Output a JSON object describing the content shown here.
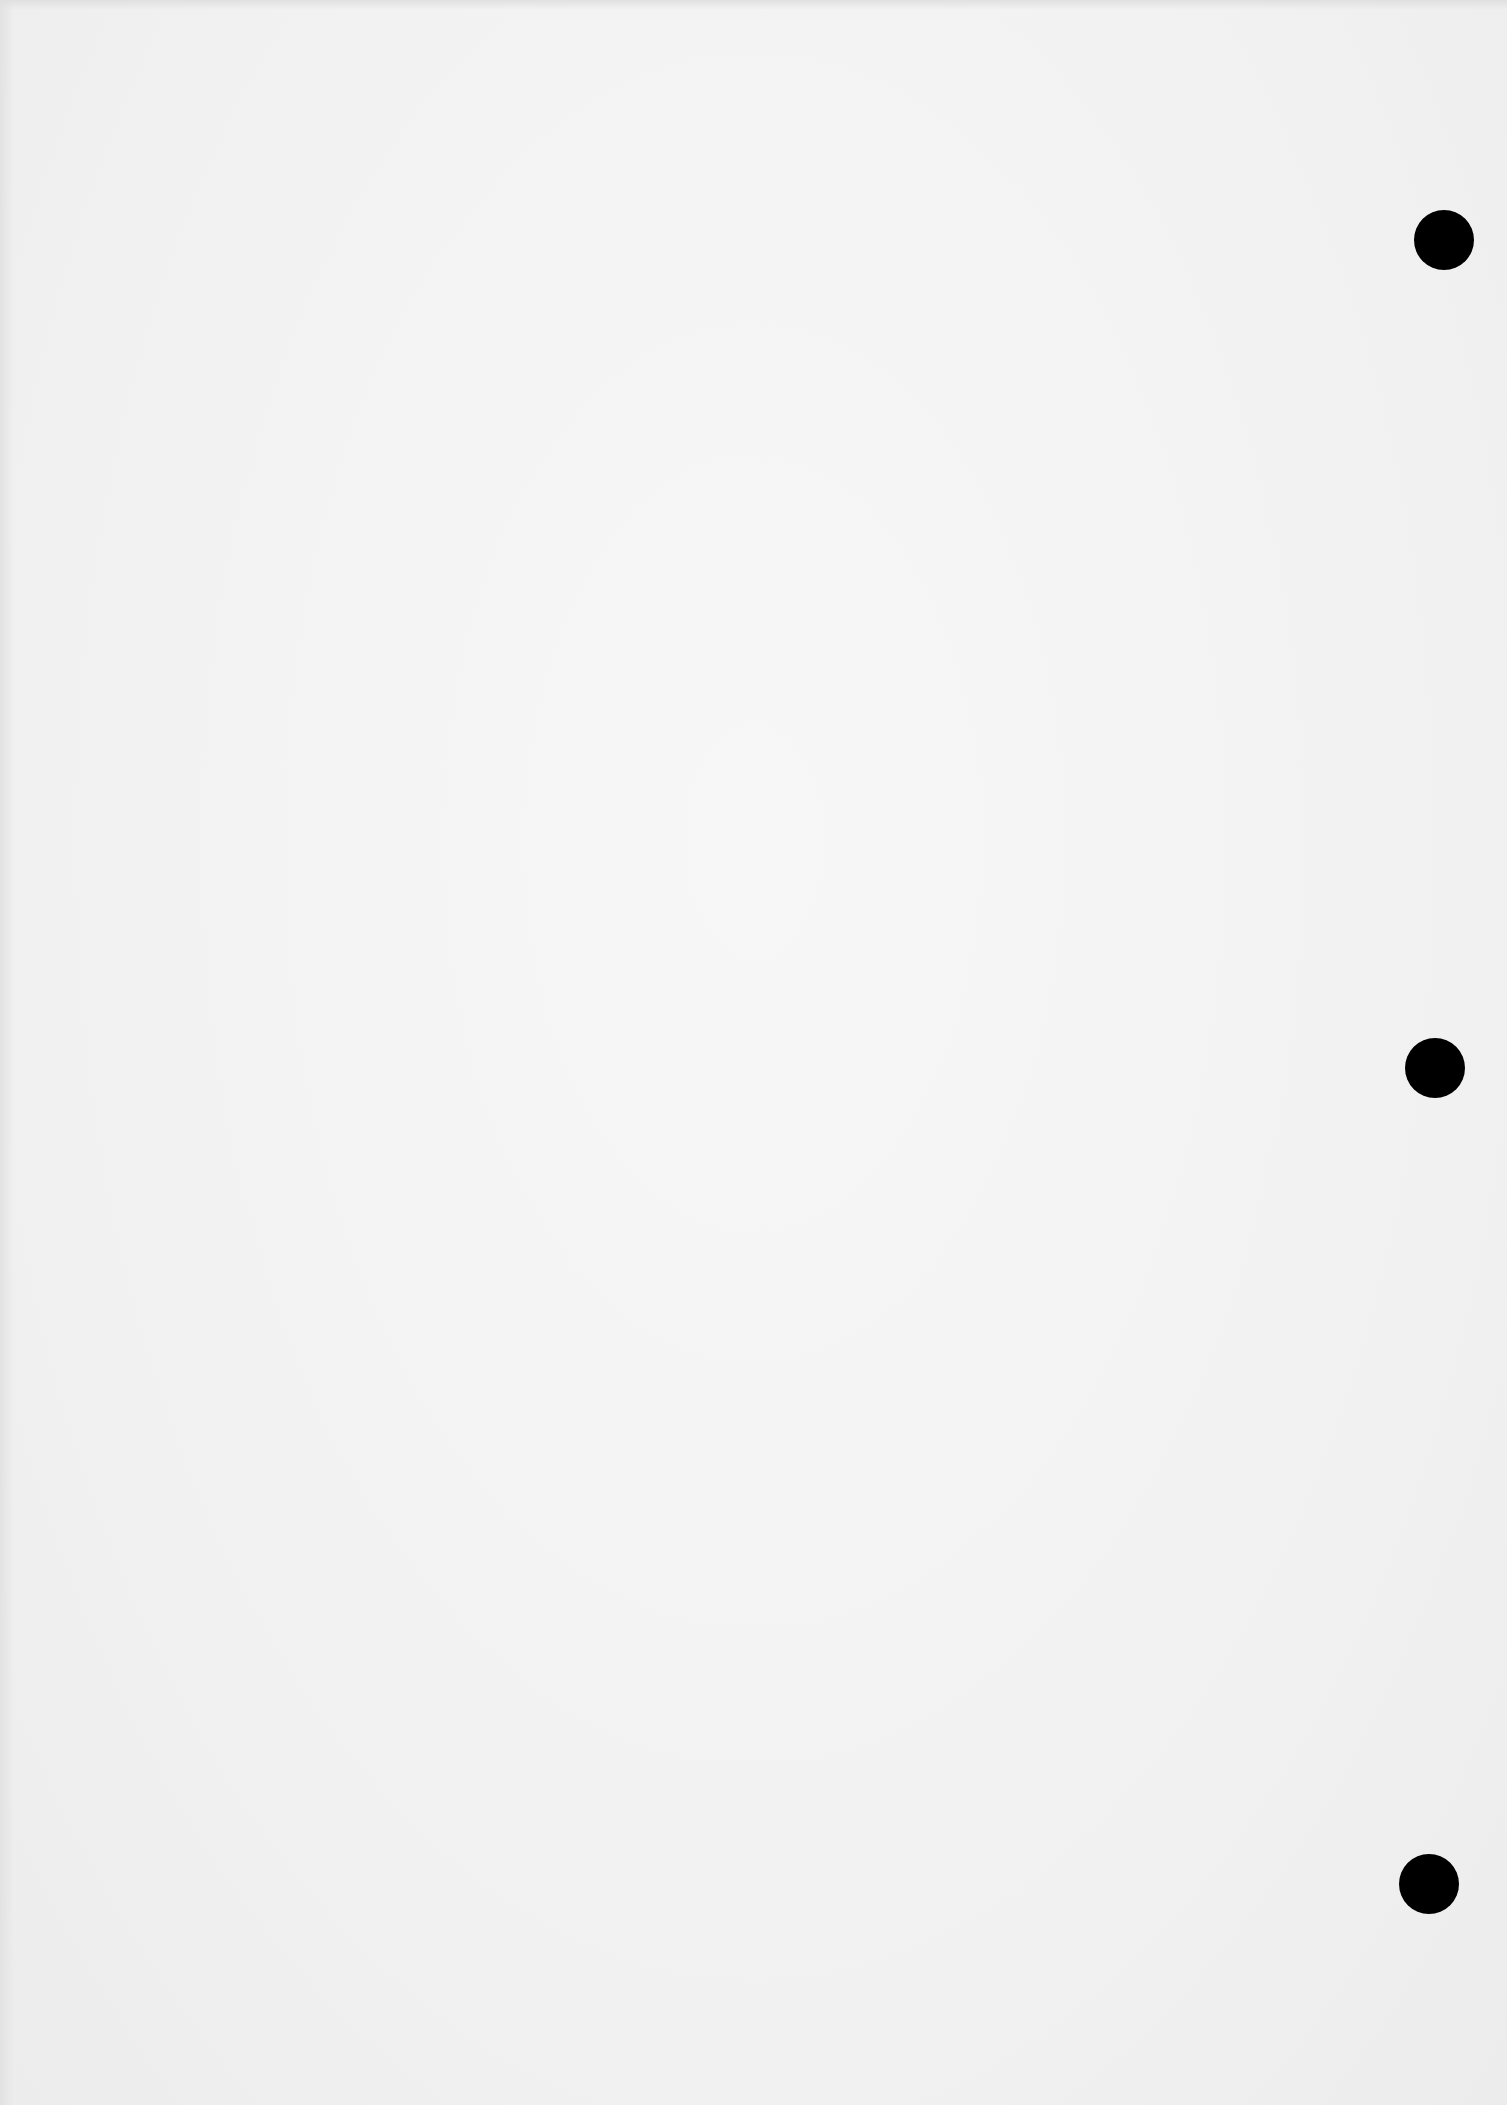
{
  "document": {
    "type": "blank scanned page",
    "text": "",
    "background_color": "#f2f2f2"
  },
  "punch_holes": [
    {
      "name": "punch-hole-top",
      "cx": 1444,
      "cy": 240,
      "r": 30,
      "color": "#000000"
    },
    {
      "name": "punch-hole-middle",
      "cx": 1435,
      "cy": 1068,
      "r": 30,
      "color": "#000000"
    },
    {
      "name": "punch-hole-bottom",
      "cx": 1429,
      "cy": 1884,
      "r": 30,
      "color": "#000000"
    }
  ]
}
